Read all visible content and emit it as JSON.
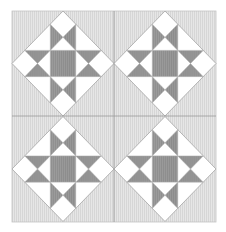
{
  "quilt": {
    "pattern": "ohio-star-on-point",
    "layout": {
      "rows": 2,
      "cols": 2
    },
    "colors": {
      "page": "#ffffff",
      "background": "#e6e6e6",
      "stripe": "#d6d6d6",
      "light": "#ffffff",
      "dark": "#9b9b9b",
      "dark_stripe": "#8c8c8c",
      "seam": "#a8a8a8",
      "divider": "#9a9a9a",
      "border": "#c4c4c4"
    },
    "frame": {
      "x": 12,
      "y": 11,
      "width": 204,
      "height": 211
    },
    "blocks": [
      {
        "id": "block-top-left",
        "row": 0,
        "col": 0
      },
      {
        "id": "block-top-right",
        "row": 0,
        "col": 1
      },
      {
        "id": "block-bottom-left",
        "row": 1,
        "col": 0
      },
      {
        "id": "block-bottom-right",
        "row": 1,
        "col": 1
      }
    ]
  }
}
